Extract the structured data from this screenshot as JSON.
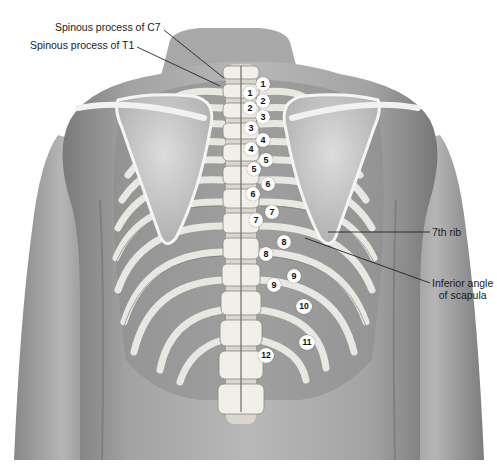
{
  "figure": {
    "type": "anatomical illustration",
    "view": "posterior thorax showing spine, ribs and scapulae",
    "colors": {
      "background": "#ffffff",
      "skin_dark": "#6f6f6f",
      "skin_mid": "#9a9a9a",
      "skin_light": "#c9c9c9",
      "bone": "#e8e6e0",
      "bone_shadow": "#8f8b84",
      "interspace": "#4a4a4a",
      "leader_line": "#222222",
      "marker_fill": "#ffffff",
      "marker_text": "#111111"
    }
  },
  "labels": {
    "c7": "Spinous process of C7",
    "t1": "Spinous process of T1",
    "rib7": "7th rib",
    "scapula_line1": "Inferior angle",
    "scapula_line2": "of scapula"
  },
  "vertebra_markers": [
    "1",
    "2",
    "3",
    "4",
    "5",
    "6",
    "7",
    "8",
    "9"
  ],
  "rib_markers": [
    "1",
    "2",
    "3",
    "4",
    "5",
    "6",
    "7",
    "8",
    "9",
    "10",
    "11",
    "12"
  ]
}
